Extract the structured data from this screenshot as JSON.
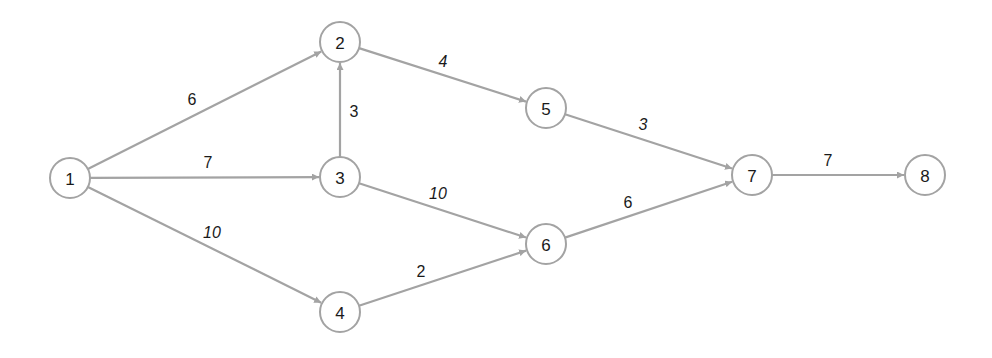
{
  "diagram": {
    "type": "directed-network",
    "colors": {
      "edge": "#a3a3a3",
      "node_stroke": "#a3a3a3",
      "text": "#1a1a1a",
      "background": "#ffffff"
    },
    "nodes": [
      {
        "id": "1",
        "label": "1",
        "x": 70,
        "y": 178
      },
      {
        "id": "2",
        "label": "2",
        "x": 340,
        "y": 42
      },
      {
        "id": "3",
        "label": "3",
        "x": 340,
        "y": 177
      },
      {
        "id": "4",
        "label": "4",
        "x": 340,
        "y": 312
      },
      {
        "id": "5",
        "label": "5",
        "x": 546,
        "y": 108
      },
      {
        "id": "6",
        "label": "6",
        "x": 546,
        "y": 244
      },
      {
        "id": "7",
        "label": "7",
        "x": 752,
        "y": 175
      },
      {
        "id": "8",
        "label": "8",
        "x": 925,
        "y": 175
      }
    ],
    "edges": [
      {
        "from": "1",
        "to": "2",
        "weight": "6",
        "lx": 192,
        "ly": 99,
        "italic": false
      },
      {
        "from": "1",
        "to": "3",
        "weight": "7",
        "lx": 208,
        "ly": 162,
        "italic": false
      },
      {
        "from": "1",
        "to": "4",
        "weight": "10",
        "lx": 212,
        "ly": 232,
        "italic": true
      },
      {
        "from": "3",
        "to": "2",
        "weight": "3",
        "lx": 354,
        "ly": 111,
        "italic": false
      },
      {
        "from": "2",
        "to": "5",
        "weight": "4",
        "lx": 443,
        "ly": 61,
        "italic": true
      },
      {
        "from": "3",
        "to": "6",
        "weight": "10",
        "lx": 438,
        "ly": 193,
        "italic": true
      },
      {
        "from": "4",
        "to": "6",
        "weight": "2",
        "lx": 421,
        "ly": 271,
        "italic": false
      },
      {
        "from": "5",
        "to": "7",
        "weight": "3",
        "lx": 643,
        "ly": 124,
        "italic": true
      },
      {
        "from": "6",
        "to": "7",
        "weight": "6",
        "lx": 628,
        "ly": 202,
        "italic": false
      },
      {
        "from": "7",
        "to": "8",
        "weight": "7",
        "lx": 828,
        "ly": 160,
        "italic": false
      }
    ]
  }
}
